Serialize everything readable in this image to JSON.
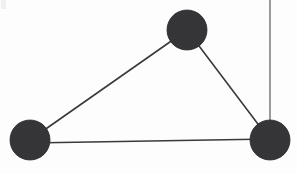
{
  "figure": {
    "kind": "node-link-diagram",
    "width": 297,
    "height": 174,
    "background_color": "#fdfdfd"
  },
  "style": {
    "node_fill": "#333336",
    "node_stroke": "#2b2b2e",
    "node_radius": 20,
    "edge_color": "#3a3a3d",
    "edge_width": 1.6,
    "pendant_edge_color": "#8f9093",
    "pendant_edge_width": 1.8,
    "texture_color": "#4a4a4d"
  },
  "chart_data": {
    "type": "scatter",
    "xlabel": "",
    "ylabel": "",
    "xlim": [
      0,
      297
    ],
    "ylim": [
      0,
      174
    ],
    "grid": false,
    "legend": "none",
    "nodes": [
      {
        "id": "top",
        "label": "",
        "x": 187,
        "y": 30,
        "r": 20,
        "color": "#333336"
      },
      {
        "id": "left",
        "label": "",
        "x": 30,
        "y": 140,
        "r": 20,
        "color": "#333336"
      },
      {
        "id": "right",
        "label": "",
        "x": 270,
        "y": 140,
        "r": 20,
        "color": "#333336"
      }
    ],
    "edges": [
      {
        "id": "edge-left-top",
        "source": "left",
        "target": "top",
        "x1": 30,
        "y1": 140,
        "x2": 187,
        "y2": 30,
        "color": "#3a3a3d",
        "width": 1.6
      },
      {
        "id": "edge-top-right",
        "source": "top",
        "target": "right",
        "x1": 187,
        "y1": 30,
        "x2": 270,
        "y2": 140,
        "color": "#3a3a3d",
        "width": 1.6
      },
      {
        "id": "edge-left-right",
        "source": "left",
        "target": "right",
        "x1": 30,
        "y1": 143,
        "x2": 270,
        "y2": 139,
        "color": "#3a3a3d",
        "width": 1.6
      }
    ],
    "pendant_edges": [
      {
        "id": "edge-right-top-border",
        "source": "right",
        "target": "image-top-edge",
        "x1": 270,
        "y1": 140,
        "x2": 270,
        "y2": 0,
        "color": "#8f9093",
        "width": 1.8
      }
    ],
    "artifacts": [
      {
        "id": "corner-speck",
        "x": 1,
        "y": 0,
        "w": 5,
        "h": 9,
        "color": "#f0f0f0"
      }
    ]
  }
}
